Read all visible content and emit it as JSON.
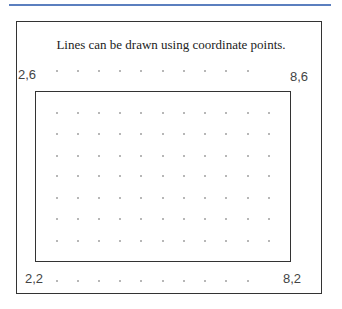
{
  "caption": "Lines can be drawn using coordinate points.",
  "colors": {
    "rule": "#5b7fbf",
    "line": "#333333",
    "dot": "#aaaaaa"
  },
  "points": [
    {
      "label": "2,6",
      "x": 2,
      "y": 6
    },
    {
      "label": "8,6",
      "x": 8,
      "y": 6
    },
    {
      "label": "2,2",
      "x": 2,
      "y": 2
    },
    {
      "label": "8,2",
      "x": 8,
      "y": 2
    }
  ],
  "grid": {
    "cols": 12,
    "rows": 9
  },
  "rectangle": {
    "from": "2,6",
    "to": "8,2"
  }
}
